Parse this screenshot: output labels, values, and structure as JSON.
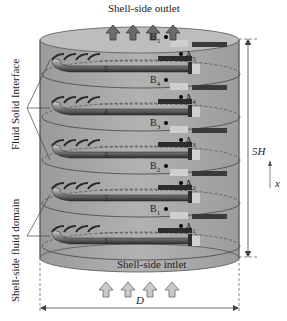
{
  "diagram": {
    "title_top": "Shell-side outlet",
    "title_bottom": "Shell-side intlet",
    "left_labels": {
      "upper": "Fluid Solid Interface",
      "lower": "Shell-side fluid domain"
    },
    "dimensions": {
      "height_label": "5H",
      "width_label": "D",
      "axis_label": "x"
    },
    "stages": [
      {
        "number": "5",
        "point_a": "A",
        "point_a_sub": "5",
        "point_b": "B",
        "point_b_sub": "5"
      },
      {
        "number": "4",
        "point_a": "A",
        "point_a_sub": "4",
        "point_b": "B",
        "point_b_sub": "4"
      },
      {
        "number": "3",
        "point_a": "A",
        "point_a_sub": "3",
        "point_b": "B",
        "point_b_sub": "3"
      },
      {
        "number": "2",
        "point_a": "A",
        "point_a_sub": "2",
        "point_b": "B",
        "point_b_sub": "2"
      },
      {
        "number": "1",
        "point_a": "A",
        "point_a_sub": "1",
        "point_b": "B",
        "point_b_sub": "1"
      }
    ],
    "colors": {
      "shell_fill": "#a9a9a9",
      "shell_top": "#b8b8b8",
      "fin_dark": "#3a3a3a",
      "arrow_fill": "#8a8a8a",
      "arrow_outline": "#555555"
    }
  }
}
